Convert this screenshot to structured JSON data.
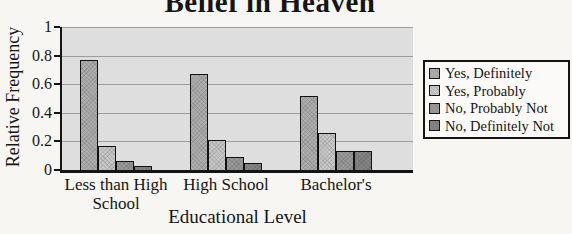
{
  "chart_data": {
    "type": "bar",
    "title": "Belief in Heaven",
    "xlabel": "Educational Level",
    "ylabel": "Relative Frequency",
    "categories": [
      "Less than High School",
      "High School",
      "Bachelor's"
    ],
    "series": [
      {
        "name": "Yes, Definitely",
        "color": "#acacac",
        "values": [
          0.77,
          0.67,
          0.52
        ]
      },
      {
        "name": "Yes, Probably",
        "color": "#c6c6c6",
        "values": [
          0.17,
          0.21,
          0.26
        ]
      },
      {
        "name": "No, Probably Not",
        "color": "#989898",
        "values": [
          0.06,
          0.09,
          0.13
        ]
      },
      {
        "name": "No, Definitely Not",
        "color": "#838383",
        "values": [
          0.03,
          0.05,
          0.13
        ]
      }
    ],
    "ylim": [
      0,
      1
    ],
    "yticks": [
      0,
      0.2,
      0.4,
      0.6,
      0.8,
      1
    ],
    "grid": true,
    "legend_position": "right",
    "plot_bg": "#dedede",
    "gridline_color": "#9c9c9c"
  }
}
